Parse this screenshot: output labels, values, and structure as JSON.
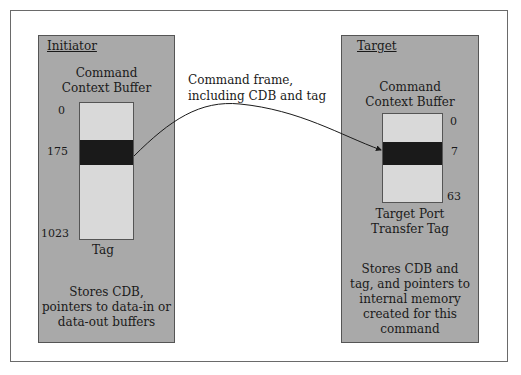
{
  "diagram": {
    "initiator": {
      "title": "Initiator",
      "buffer_label_line1": "Command",
      "buffer_label_line2": "Context Buffer",
      "index_top": "0",
      "index_tag": "175",
      "index_bottom": "1023",
      "below_label": "Tag",
      "desc_line1": "Stores CDB,",
      "desc_line2": "pointers to data-in or",
      "desc_line3": "data-out buffers"
    },
    "target": {
      "title": "Target",
      "buffer_label_line1": "Command",
      "buffer_label_line2": "Context Buffer",
      "index_top": "0",
      "index_tag": "7",
      "index_bottom": "63",
      "below_label_line1": "Target Port",
      "below_label_line2": "Transfer Tag",
      "desc_line1": "Stores CDB and",
      "desc_line2": "tag, and pointers to",
      "desc_line3": "internal memory",
      "desc_line4": "created for this",
      "desc_line5": "command"
    },
    "connector": {
      "label_line1": "Command frame,",
      "label_line2": "including CDB and tag"
    },
    "colors": {
      "panel": "#a9a9a9",
      "buffer": "#d9d9d9",
      "tag_band": "#1a1a1a",
      "frame_border": "#6a6a6a"
    }
  }
}
